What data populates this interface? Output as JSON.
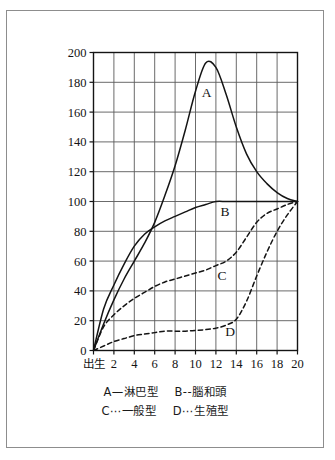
{
  "figure": {
    "frame_color": "#8d8d8d",
    "background": "#ffffff",
    "axis_color": "#141414",
    "grid_color": "#5a5a5a"
  },
  "legend": {
    "rows": [
      [
        {
          "key": "A",
          "sep": "—",
          "label": "淋巴型",
          "text": "A—淋巴型"
        },
        {
          "key": "B",
          "sep": "--",
          "label": "腦和頭",
          "text": "B--腦和頭"
        }
      ],
      [
        {
          "key": "C",
          "sep": "⋯",
          "label": "一般型",
          "text": "C⋯一般型"
        },
        {
          "key": "D",
          "sep": "⋯",
          "label": "生殖型",
          "text": "D⋯生殖型"
        }
      ]
    ]
  },
  "chart_data": {
    "type": "line",
    "title": "",
    "xlabel": "",
    "ylabel": "",
    "xlim": [
      0,
      20
    ],
    "ylim": [
      0,
      200
    ],
    "grid": true,
    "legend_position": "below-plot",
    "x_tick_labels": [
      "出生",
      "2",
      "4",
      "6",
      "8",
      "10",
      "12",
      "14",
      "16",
      "18",
      "20"
    ],
    "x_ticks": [
      0,
      2,
      4,
      6,
      8,
      10,
      12,
      14,
      16,
      18,
      20
    ],
    "y_tick_labels": [
      "0",
      "20",
      "40",
      "60",
      "80",
      "100",
      "120",
      "140",
      "160",
      "180",
      "200"
    ],
    "y_ticks": [
      0,
      20,
      40,
      60,
      80,
      100,
      120,
      140,
      160,
      180,
      200
    ],
    "x": [
      0,
      1,
      2,
      3,
      4,
      5,
      6,
      7,
      8,
      9,
      10,
      11,
      12,
      13,
      14,
      15,
      16,
      17,
      18,
      19,
      20
    ],
    "series": [
      {
        "name": "A",
        "label": "淋巴型",
        "style": "solid",
        "letter_label": "A",
        "letter_at": {
          "x": 11.1,
          "y": 170
        },
        "values": [
          0,
          18,
          34,
          48,
          60,
          72,
          86,
          104,
          124,
          148,
          174,
          193,
          190,
          172,
          150,
          132,
          120,
          112,
          106,
          102,
          100
        ]
      },
      {
        "name": "B",
        "label": "腦和頭",
        "style": "solid",
        "letter_label": "B",
        "letter_at": {
          "x": 12.9,
          "y": 90
        },
        "values": [
          0,
          28,
          44,
          58,
          70,
          78,
          83,
          87,
          90,
          93,
          96,
          98,
          100,
          100,
          100,
          100,
          100,
          100,
          100,
          100,
          100
        ]
      },
      {
        "name": "C",
        "label": "一般型",
        "style": "dashed",
        "letter_label": "C",
        "letter_at": {
          "x": 12.6,
          "y": 47
        },
        "values": [
          0,
          16,
          24,
          30,
          35,
          39,
          43,
          46,
          48,
          50,
          52,
          54,
          57,
          60,
          66,
          76,
          86,
          92,
          95,
          98,
          100
        ]
      },
      {
        "name": "D",
        "label": "生殖型",
        "style": "dashed",
        "letter_label": "D",
        "letter_at": {
          "x": 13.4,
          "y": 10
        },
        "values": [
          0,
          3,
          6,
          8,
          10,
          11,
          12,
          13,
          13,
          13,
          13.5,
          14,
          15,
          17,
          21,
          33,
          50,
          66,
          80,
          91,
          100
        ]
      }
    ]
  }
}
